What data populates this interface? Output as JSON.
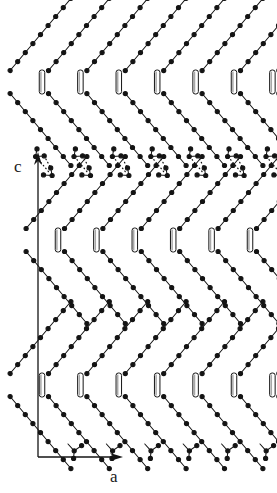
{
  "figure": {
    "background_color": "#ffffff",
    "ink_color": "#141414",
    "bar_fill_color": "#ffffff",
    "bar_shade_color": "#a8a8a8"
  },
  "axes": {
    "vertical": {
      "label": "c",
      "label_x": 14,
      "label_y": 172,
      "arrow_x": 38,
      "arrow_top_y": 156,
      "arrow_bottom_y": 457
    },
    "horizontal": {
      "label": "a",
      "label_x": 110,
      "label_y": 482,
      "arrow_y": 457,
      "arrow_left_x": 38,
      "arrow_right_x": 119
    }
  },
  "lattice": {
    "column_spacing": 38.4,
    "columns": 6,
    "row_spacing": 158,
    "chain_bond_dx": 7.6,
    "chain_bond_dy": 9.0,
    "atom_radius": 2.1,
    "bar_width": 5.5,
    "bar_height": 24
  },
  "chevron_rows": [
    {
      "name": "row-upper-apex",
      "apex_y": 82,
      "apex_x_start": 42.0,
      "arm_atoms_up": 9,
      "arm_atoms_down": 9
    },
    {
      "name": "row-mid-apex",
      "apex_y": 240,
      "apex_x_start": 58.0,
      "arm_atoms_up": 9,
      "arm_atoms_down": 9
    },
    {
      "name": "row-lower-apex",
      "apex_y": 385,
      "apex_x_start": 42.0,
      "arm_atoms_up": 9,
      "arm_atoms_down": 9
    }
  ],
  "hydrogen_bond_row": {
    "name": "carboxyl-dimer-band",
    "y_center": 166,
    "dimer_count": 5,
    "x_start": 74.0,
    "spacing": 38.4,
    "dot_count": 7,
    "description": "Cyclic carboxylic-acid dimers linked by two dotted O-H...O hydrogen bonds"
  },
  "terminal_groups": {
    "name": "carboxyl-terminal-row",
    "y": 444,
    "x_start": 68.0,
    "count": 6,
    "spacing": 38.4
  },
  "legend": {
    "atom": "filled-circle-carbon",
    "bond": "solid-line-covalent-bond",
    "hbond": "dotted-line-hydrogen-bond",
    "bar": "hollow-vertical-bar-edge-on-group"
  }
}
